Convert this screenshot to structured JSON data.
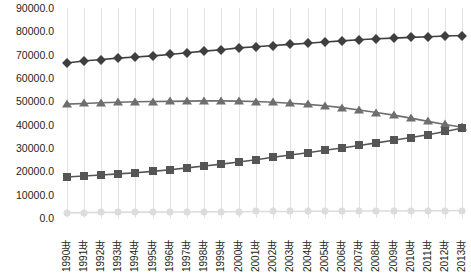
{
  "chart_data": {
    "type": "line",
    "title": "",
    "subtitle": "",
    "xlabel": "",
    "ylabel": "",
    "grid": "vertical-only",
    "legend_position": "none",
    "ylim": [
      0,
      90000
    ],
    "ytick_step": 10000,
    "ytick_labels": [
      "90000.0",
      "80000.0",
      "70000.0",
      "60000.0",
      "50000.0",
      "40000.0",
      "30000.0",
      "20000.0",
      "10000.0",
      "0.0"
    ],
    "categories": [
      "1990年",
      "1991年",
      "1992年",
      "1993年",
      "1994年",
      "1995年",
      "1996年",
      "1997年",
      "1998年",
      "1999年",
      "2000年",
      "2001年",
      "2002年",
      "2003年",
      "2004年",
      "2005年",
      "2006年",
      "2007年",
      "2008年",
      "2009年",
      "2010年",
      "2011年",
      "2012年",
      "2013年"
    ],
    "series": [
      {
        "name": "series-diamond",
        "marker": "diamond",
        "color": "#3f3f3f",
        "values": [
          66400,
          67300,
          67900,
          68500,
          69000,
          69500,
          70100,
          70800,
          71500,
          72100,
          72900,
          73400,
          73900,
          74400,
          74900,
          75400,
          75900,
          76400,
          76800,
          77100,
          77400,
          77700,
          78000,
          78200
        ]
      },
      {
        "name": "series-triangle",
        "marker": "triangle",
        "color": "#6e6e6e",
        "values": [
          48800,
          49100,
          49400,
          49600,
          49800,
          49900,
          50000,
          50100,
          50200,
          50200,
          50100,
          49900,
          49600,
          49200,
          48700,
          48100,
          47300,
          46300,
          45200,
          44100,
          42800,
          41400,
          40100,
          38900
        ]
      },
      {
        "name": "series-square",
        "marker": "square",
        "color": "#555555",
        "values": [
          17600,
          18000,
          18400,
          18900,
          19400,
          20000,
          20700,
          21500,
          22300,
          23100,
          24000,
          25000,
          26000,
          27000,
          28000,
          29000,
          30000,
          31100,
          32200,
          33300,
          34500,
          35700,
          37100,
          38600
        ]
      },
      {
        "name": "series-circle",
        "marker": "circle",
        "color": "#dcdcdc",
        "values": [
          2200,
          2300,
          2400,
          2400,
          2500,
          2500,
          2600,
          2600,
          2700,
          2700,
          2700,
          2800,
          2800,
          2800,
          2900,
          2900,
          2900,
          3000,
          3000,
          3000,
          3100,
          3100,
          3100,
          3200
        ]
      }
    ]
  }
}
